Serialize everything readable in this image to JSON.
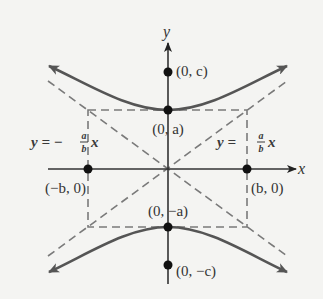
{
  "diagram": {
    "axes": {
      "x_label": "x",
      "y_label": "y"
    },
    "points": [
      {
        "id": "focus-top",
        "label": "(0, c)"
      },
      {
        "id": "vertex-top",
        "label": "(0, a)"
      },
      {
        "id": "co-vertex-left",
        "label": "(−b, 0)"
      },
      {
        "id": "co-vertex-right",
        "label": "(b, 0)"
      },
      {
        "id": "vertex-bottom",
        "label": "(0, −a)"
      },
      {
        "id": "focus-bottom",
        "label": "(0, −c)"
      }
    ],
    "asymptotes": {
      "left": {
        "prefix": "y = −",
        "num": "a",
        "den": "b",
        "suffix": "x"
      },
      "right": {
        "prefix": "y = ",
        "num": "a",
        "den": "b",
        "suffix": "x"
      }
    },
    "colors": {
      "background": "#f4f4f2",
      "curve": "#555555",
      "axes": "#333333",
      "dashed": "#7a7a7a",
      "points": "#111111"
    }
  }
}
